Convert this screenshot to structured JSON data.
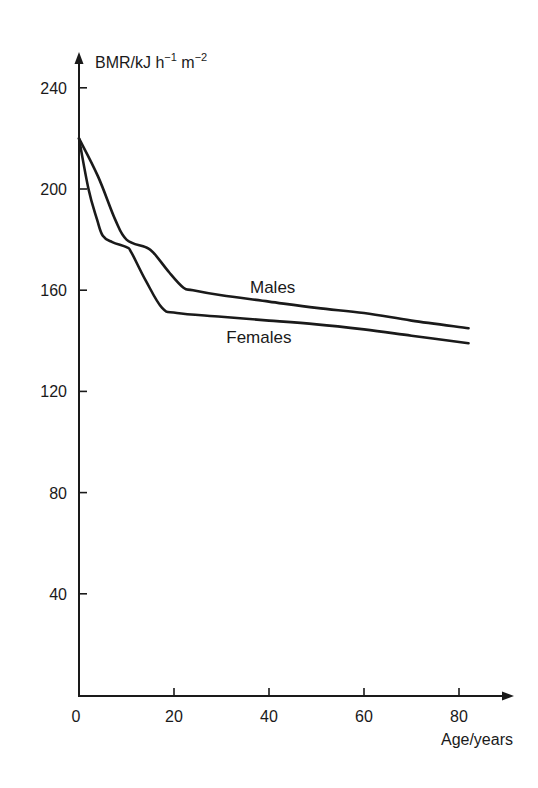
{
  "chart_data": {
    "type": "line",
    "title": "",
    "xlabel": "Age/years",
    "ylabel": "BMR/kJ h⁻¹ m⁻²",
    "ylabel_parts": {
      "base": "BMR/kJ h",
      "exp1": "−1",
      "mid": " m",
      "exp2": "−2"
    },
    "xlim": [
      0,
      85
    ],
    "ylim": [
      0,
      250
    ],
    "xticks": [
      0,
      20,
      40,
      60,
      80
    ],
    "yticks": [
      40,
      80,
      120,
      160,
      200,
      240
    ],
    "grid": false,
    "legend": "inline labels",
    "series": [
      {
        "name": "Males",
        "label_pos": {
          "x": 36,
          "y": 159
        },
        "x": [
          0,
          4,
          7.6,
          10,
          14,
          15.6,
          19,
          22,
          24,
          30,
          40,
          50,
          60,
          70,
          82
        ],
        "y": [
          220,
          205,
          188,
          180,
          177,
          175,
          167,
          161,
          160,
          158,
          155.5,
          153,
          151,
          148,
          145
        ]
      },
      {
        "name": "Females",
        "label_pos": {
          "x": 31,
          "y": 139
        },
        "x": [
          0,
          2,
          3.8,
          5,
          7,
          10,
          11,
          14,
          17.5,
          20.6,
          30,
          40,
          50,
          60,
          70,
          82
        ],
        "y": [
          220,
          200,
          188,
          181.5,
          179,
          177,
          175,
          164,
          153,
          151,
          149.5,
          148,
          146.5,
          144.5,
          142,
          139
        ]
      }
    ]
  },
  "colors": {
    "ink": "#1a1a1a",
    "background": "#ffffff"
  }
}
